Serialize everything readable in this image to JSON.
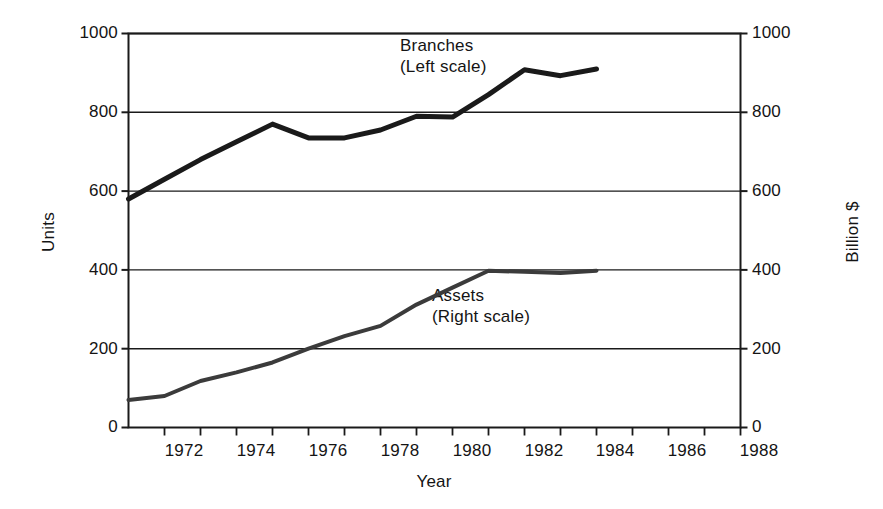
{
  "chart_data": {
    "type": "line",
    "title": "",
    "xlabel": "Year",
    "ylabel": "Units",
    "y2label": "Billion $",
    "xlim": [
      1971,
      1988
    ],
    "ylim": [
      0,
      1000
    ],
    "y2lim": [
      0,
      1000
    ],
    "grid": true,
    "legend_position": "inline-annotation",
    "x_ticks_all": [
      1971,
      1972,
      1973,
      1974,
      1975,
      1976,
      1977,
      1978,
      1979,
      1980,
      1981,
      1982,
      1983,
      1984,
      1985,
      1986,
      1987,
      1988
    ],
    "x_tick_labels": [
      "1972",
      "1974",
      "1976",
      "1978",
      "1980",
      "1982",
      "1984",
      "1986",
      "1988"
    ],
    "x_tick_label_values": [
      1972,
      1974,
      1976,
      1978,
      1980,
      1982,
      1984,
      1986,
      1988
    ],
    "y_tick_labels": [
      "0",
      "200",
      "400",
      "600",
      "800",
      "1000"
    ],
    "y_tick_values": [
      0,
      200,
      400,
      600,
      800,
      1000
    ],
    "y2_tick_labels": [
      "0",
      "200",
      "400",
      "600",
      "800",
      "1000"
    ],
    "y2_tick_values": [
      0,
      200,
      400,
      600,
      800,
      1000
    ],
    "x": [
      1971,
      1972,
      1973,
      1974,
      1975,
      1976,
      1977,
      1978,
      1979,
      1980,
      1981,
      1982,
      1983,
      1984
    ],
    "series": [
      {
        "name": "Branches",
        "annotation": "Branches",
        "annotation_scale": "(Left scale)",
        "axis": "left",
        "units": "Units",
        "color": "#1a1a1a",
        "linewidth": 5,
        "values": [
          580,
          630,
          680,
          725,
          770,
          735,
          735,
          755,
          790,
          788,
          845,
          908,
          893,
          910
        ]
      },
      {
        "name": "Assets",
        "annotation": "Assets",
        "annotation_scale": "(Right scale)",
        "axis": "right",
        "units": "Billion $",
        "color": "#3b3b3b",
        "linewidth": 4,
        "values": [
          70,
          80,
          118,
          140,
          165,
          200,
          232,
          258,
          312,
          355,
          398,
          395,
          392,
          398
        ]
      }
    ]
  },
  "annotations": {
    "branches": {
      "line1": "Branches",
      "line2": "(Left scale)"
    },
    "assets": {
      "line1": "Assets",
      "line2": "(Right scale)"
    }
  },
  "axes": {
    "left_title": "Units",
    "right_title": "Billion $",
    "x_title": "Year"
  },
  "colors": {
    "background": "#ffffff",
    "frame": "#1a1a1a",
    "gridline": "#1a1a1a",
    "branches_line": "#1a1a1a",
    "assets_line": "#3b3b3b",
    "text": "#141414"
  }
}
